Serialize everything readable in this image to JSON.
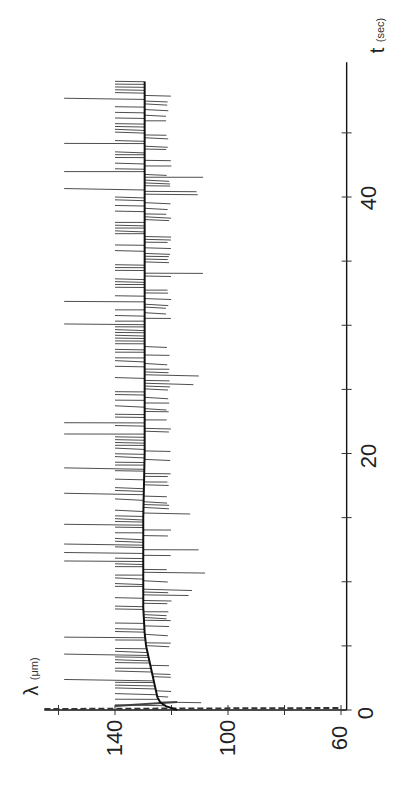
{
  "chart_data": {
    "type": "line",
    "orientation": "rotated-90",
    "title": "",
    "xlabel": "t (sec)",
    "ylabel": "λ (μm)",
    "x_axis": {
      "label": "t",
      "unit": "(sec)",
      "range": [
        0,
        50
      ],
      "ticks": [
        0,
        20,
        40
      ],
      "minor_ticks": [
        5,
        10,
        15,
        25,
        30,
        35,
        45
      ]
    },
    "y_axis": {
      "label": "λ",
      "unit": "(μm)",
      "range": [
        58,
        165
      ],
      "ticks": [
        140,
        100,
        60
      ],
      "minor_ticks": [
        160,
        120,
        80
      ],
      "inverted": true
    },
    "grid": false,
    "legend": null,
    "series": [
      {
        "name": "mean wavelength",
        "style": "thick",
        "x": [
          0,
          0.3,
          0.6,
          1,
          2,
          3,
          4,
          5,
          6,
          8,
          10,
          15,
          20,
          25,
          30,
          35,
          40,
          45,
          49
        ],
        "values": [
          118,
          122,
          124,
          125,
          126,
          127,
          128,
          129,
          129.5,
          130,
          130,
          130,
          129.5,
          129.5,
          129.5,
          129.5,
          129.5,
          129.5,
          129.5
        ]
      },
      {
        "name": "instantaneous wavelength",
        "style": "thin",
        "description": "rapid fluctuations between ~140 μm and ~120 μm with intermittent spikes to ~158 μm and ~108 μm",
        "envelope_upper": 158,
        "envelope_main_upper": 140,
        "envelope_main_lower": 120,
        "envelope_lower": 108
      },
      {
        "name": "initial transient",
        "style": "dashed",
        "x": [
          0,
          0.1,
          0.2
        ],
        "values": [
          165,
          90,
          60
        ]
      }
    ],
    "axis_labels": {
      "t_ticks": [
        "0",
        "20",
        "40"
      ],
      "lambda_ticks": [
        "140",
        "100",
        "60"
      ]
    }
  }
}
